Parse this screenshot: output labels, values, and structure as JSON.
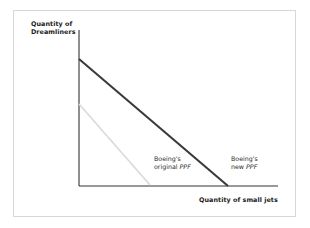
{
  "figure": {
    "background_color": "#ffffff",
    "frame_color": "#d8d8d8"
  },
  "axes": {
    "y_label": "Quantity of\nDreamliners",
    "x_label": "Quantity of small jets",
    "axis_color": "#333333"
  },
  "annotations": {
    "original": {
      "line1": "Boeing's",
      "line2_prefix": "original ",
      "line2_em": "PPF"
    },
    "new": {
      "line1": "Boeing's",
      "line2_prefix": "new ",
      "line2_em": "PPF"
    }
  },
  "chart_data": {
    "type": "line",
    "title": "",
    "xlabel": "Quantity of small jets",
    "ylabel": "Quantity of Dreamliners",
    "grid": false,
    "legend": "inline-annotations",
    "axis_ranges": {
      "x": [
        0,
        100
      ],
      "y": [
        0,
        100
      ]
    },
    "series": [
      {
        "name": "Boeing's original PPF",
        "color": "#d9d9d9",
        "width": 1.6,
        "points": [
          {
            "x": 0,
            "y": 64
          },
          {
            "x": 36,
            "y": 0
          }
        ],
        "px": [
          {
            "x": 79,
            "y": 104
          },
          {
            "x": 150,
            "y": 185
          }
        ]
      },
      {
        "name": "Boeing's new PPF",
        "color": "#3a3a3a",
        "width": 2.1,
        "points": [
          {
            "x": 0,
            "y": 100
          },
          {
            "x": 75,
            "y": 0
          }
        ],
        "px": [
          {
            "x": 79,
            "y": 59
          },
          {
            "x": 228,
            "y": 186
          }
        ]
      }
    ],
    "axis_px": {
      "y_axis": {
        "x": 79,
        "y_top": 30,
        "y_bottom": 186
      },
      "x_axis": {
        "y": 186,
        "x_left": 79,
        "x_right": 278
      }
    }
  }
}
